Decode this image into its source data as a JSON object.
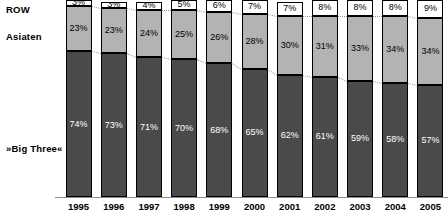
{
  "categories_axis": {
    "labels": [
      "ROW",
      "Asiaten",
      "»Big Three«"
    ]
  },
  "colors": {
    "row": "#ffffff",
    "asiaten": "#b3b3b3",
    "big_three": "#4a4a4a",
    "outline": "#000000",
    "axis": "#8c8c8c",
    "connector": "#9a9a9a"
  },
  "chart_data": {
    "type": "bar",
    "subtype": "stacked-100-percent",
    "title": "",
    "subtitle": "",
    "xlabel": "",
    "ylabel": "",
    "ylim": [
      0,
      100
    ],
    "grid": false,
    "legend_position": "left-row-labels",
    "categories": [
      "1995",
      "1996",
      "1997",
      "1998",
      "1999",
      "2000",
      "2001",
      "2002",
      "2003",
      "2004",
      "2005"
    ],
    "series": [
      {
        "name": "»Big Three«",
        "values": [
          74,
          73,
          71,
          70,
          68,
          65,
          62,
          61,
          59,
          58,
          57
        ],
        "labels": [
          "74%",
          "73%",
          "71%",
          "70%",
          "68%",
          "65%",
          "62%",
          "61%",
          "59%",
          "58%",
          "57%"
        ],
        "color": "#4a4a4a"
      },
      {
        "name": "Asiaten",
        "values": [
          23,
          23,
          24,
          25,
          26,
          28,
          30,
          31,
          33,
          34,
          34
        ],
        "labels": [
          "23%",
          "23%",
          "24%",
          "25%",
          "26%",
          "28%",
          "30%",
          "31%",
          "33%",
          "34%",
          "34%"
        ],
        "color": "#b3b3b3"
      },
      {
        "name": "ROW",
        "values": [
          3,
          3,
          4,
          5,
          6,
          7,
          7,
          8,
          8,
          8,
          9
        ],
        "labels": [
          "3%",
          "3%",
          "4%",
          "5%",
          "6%",
          "7%",
          "7%",
          "8%",
          "8%",
          "8%",
          "9%"
        ],
        "color": "#ffffff"
      }
    ]
  }
}
